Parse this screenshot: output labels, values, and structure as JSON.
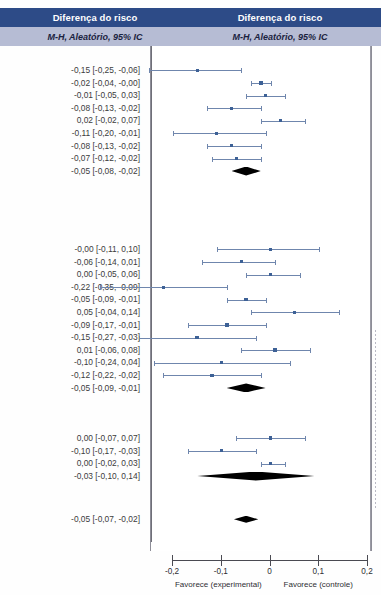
{
  "header": {
    "left": {
      "title": "Diferença do risco",
      "subtitle": "M-H, Aleatório, 95% IC"
    },
    "right": {
      "title": "Diferença do risco",
      "subtitle": "M-H, Aleatório, 95% IC"
    }
  },
  "axis": {
    "ticks": [
      "-0,2",
      "-0,1",
      "0",
      "0,1",
      "0,2"
    ],
    "tick_values": [
      -0.2,
      -0.1,
      0,
      0.1,
      0.2
    ],
    "left_caption": "Favorece (experimental)",
    "right_caption": "Favorece (controle)",
    "xmin": -0.2,
    "xmax": 0.2
  },
  "colors": {
    "header_dark": "#2d4b87",
    "header_light": "#b6bcd4",
    "marker": "#3d6196",
    "ci_line": "#6f86ad",
    "diamond": "#000000",
    "zero_line": "#6f6f78"
  },
  "chart_data": {
    "type": "forest",
    "title": "Diferença do risco",
    "subtitle": "M-H, Aleatório, 95% IC",
    "xlabel": "",
    "ylabel": "",
    "xlim": [
      -0.2,
      0.2
    ],
    "grid": false,
    "legend": "none",
    "effect_measure": "Diferença do risco",
    "model": "M-H, Aleatório, 95% IC",
    "null_value": 0,
    "subgroups": [
      {
        "name": "subgroup-1",
        "rows": [
          {
            "label": "-0,15 [-0,25, -0,06]",
            "estimate": -0.15,
            "lower": -0.25,
            "upper": -0.06,
            "type": "study",
            "weight": 0.9
          },
          {
            "label": "-0,02 [-0,04, -0,00]",
            "estimate": -0.02,
            "lower": -0.04,
            "upper": -0.0,
            "type": "study",
            "weight": 1.6
          },
          {
            "label": "-0,01 [-0,05, 0,03]",
            "estimate": -0.01,
            "lower": -0.05,
            "upper": 0.03,
            "type": "study",
            "weight": 1.4
          },
          {
            "label": "-0,08 [-0,13, -0,02]",
            "estimate": -0.08,
            "lower": -0.13,
            "upper": -0.02,
            "type": "study",
            "weight": 1.2
          },
          {
            "label": "0,02 [-0,02, 0,07]",
            "estimate": 0.02,
            "lower": -0.02,
            "upper": 0.07,
            "type": "study",
            "weight": 1.2
          },
          {
            "label": "-0,11 [-0,20, -0,01]",
            "estimate": -0.11,
            "lower": -0.2,
            "upper": -0.01,
            "type": "study",
            "weight": 1.0
          },
          {
            "label": "-0,08 [-0,13, -0,02]",
            "estimate": -0.08,
            "lower": -0.13,
            "upper": -0.02,
            "type": "study",
            "weight": 1.2
          },
          {
            "label": "-0,07 [-0,12, -0,02]",
            "estimate": -0.07,
            "lower": -0.12,
            "upper": -0.02,
            "type": "study",
            "weight": 1.2
          },
          {
            "label": "-0,05 [-0,08, -0,02]",
            "estimate": -0.05,
            "lower": -0.08,
            "upper": -0.02,
            "type": "summary"
          }
        ]
      },
      {
        "name": "subgroup-2",
        "rows": [
          {
            "label": "-0,00 [-0,11, 0,10]",
            "estimate": -0.0,
            "lower": -0.11,
            "upper": 0.1,
            "type": "study",
            "weight": 1.3
          },
          {
            "label": "-0,06 [-0,14, 0,01]",
            "estimate": -0.06,
            "lower": -0.14,
            "upper": 0.01,
            "type": "study",
            "weight": 1.2
          },
          {
            "label": "0,00 [-0,05, 0,06]",
            "estimate": 0.0,
            "lower": -0.05,
            "upper": 0.06,
            "type": "study",
            "weight": 1.2
          },
          {
            "label": "-0,22 [-0,35, -0,09]",
            "estimate": -0.22,
            "lower": -0.35,
            "upper": -0.09,
            "type": "study",
            "weight": 1.1
          },
          {
            "label": "-0,05 [-0,09, -0,01]",
            "estimate": -0.05,
            "lower": -0.09,
            "upper": -0.01,
            "type": "study",
            "weight": 1.3
          },
          {
            "label": "0,05 [-0,04, 0,14]",
            "estimate": 0.05,
            "lower": -0.04,
            "upper": 0.14,
            "type": "study",
            "weight": 1.1
          },
          {
            "label": "-0,09 [-0,17, -0,01]",
            "estimate": -0.09,
            "lower": -0.17,
            "upper": -0.01,
            "type": "study",
            "weight": 1.5
          },
          {
            "label": "-0,15 [-0,27, -0,03]",
            "estimate": -0.15,
            "lower": -0.27,
            "upper": -0.03,
            "type": "study",
            "weight": 1.5
          },
          {
            "label": "0,01 [-0,06, 0,08]",
            "estimate": 0.01,
            "lower": -0.06,
            "upper": 0.08,
            "type": "study",
            "weight": 1.6
          },
          {
            "label": "-0,10 [-0,24, 0,04]",
            "estimate": -0.1,
            "lower": -0.24,
            "upper": 0.04,
            "type": "study",
            "weight": 1.3
          },
          {
            "label": "-0,12 [-0,22, -0,02]",
            "estimate": -0.12,
            "lower": -0.22,
            "upper": -0.02,
            "type": "study",
            "weight": 1.2
          },
          {
            "label": "-0,05 [-0,09, -0,01]",
            "estimate": -0.05,
            "lower": -0.09,
            "upper": -0.01,
            "type": "summary"
          }
        ]
      },
      {
        "name": "subgroup-3",
        "rows": [
          {
            "label": "0,00 [-0,07, 0,07]",
            "estimate": 0.0,
            "lower": -0.07,
            "upper": 0.07,
            "type": "study",
            "weight": 1.5
          },
          {
            "label": "-0,10 [-0,17, -0,03]",
            "estimate": -0.1,
            "lower": -0.17,
            "upper": -0.03,
            "type": "study",
            "weight": 1.1
          },
          {
            "label": "0,00 [-0,02, 0,03]",
            "estimate": 0.0,
            "lower": -0.02,
            "upper": 0.03,
            "type": "study",
            "weight": 1.4
          },
          {
            "label": "-0,03 [-0,10, 0,14]",
            "estimate": -0.03,
            "lower": -0.1,
            "upper": 0.14,
            "type": "summary"
          }
        ]
      },
      {
        "name": "overall",
        "rows": [
          {
            "label": "-0,05 [-0,07, -0,02]",
            "estimate": -0.05,
            "lower": -0.07,
            "upper": -0.02,
            "type": "summary",
            "small": true
          }
        ]
      }
    ]
  },
  "layout": {
    "row_tops": {
      "subgroup-1": 64,
      "subgroup-2": 243,
      "subgroup-3": 432,
      "overall": 513
    },
    "row_height": 12.6
  }
}
